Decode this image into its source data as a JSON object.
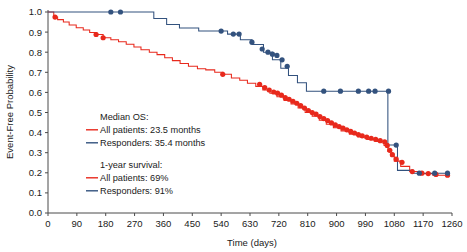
{
  "chart_data": {
    "type": "line",
    "title": "",
    "xlabel": "Time (days)",
    "ylabel": "Event-Free Probability",
    "xlim": [
      0,
      1260
    ],
    "ylim": [
      0.0,
      1.0
    ],
    "grid": false,
    "legend_position": "inside-left",
    "xticks": [
      0,
      90,
      180,
      270,
      360,
      450,
      540,
      630,
      720,
      810,
      900,
      990,
      1080,
      1170,
      1260
    ],
    "ytick_labels": [
      "1.0",
      "0.9",
      "0.8",
      "0.7",
      "0.6",
      "0.5",
      "0.4",
      "0.3",
      "0.2",
      "0.1",
      "0.0"
    ],
    "ytick_values": [
      1.0,
      0.9,
      0.8,
      0.7,
      0.6,
      0.5,
      0.4,
      0.3,
      0.2,
      0.1,
      0.0
    ],
    "series": [
      {
        "name": "All patients",
        "color": "#e8291c",
        "marker": "censor-circle",
        "steps": [
          [
            0,
            1.0
          ],
          [
            18,
            1.0
          ],
          [
            18,
            0.975
          ],
          [
            30,
            0.975
          ],
          [
            30,
            0.962
          ],
          [
            48,
            0.962
          ],
          [
            48,
            0.95
          ],
          [
            66,
            0.95
          ],
          [
            66,
            0.935
          ],
          [
            88,
            0.935
          ],
          [
            88,
            0.922
          ],
          [
            110,
            0.922
          ],
          [
            110,
            0.91
          ],
          [
            130,
            0.91
          ],
          [
            130,
            0.898
          ],
          [
            152,
            0.898
          ],
          [
            152,
            0.888
          ],
          [
            172,
            0.888
          ],
          [
            172,
            0.872
          ],
          [
            196,
            0.872
          ],
          [
            196,
            0.862
          ],
          [
            220,
            0.862
          ],
          [
            220,
            0.852
          ],
          [
            244,
            0.852
          ],
          [
            244,
            0.84
          ],
          [
            268,
            0.84
          ],
          [
            268,
            0.826
          ],
          [
            290,
            0.826
          ],
          [
            290,
            0.812
          ],
          [
            316,
            0.812
          ],
          [
            316,
            0.8
          ],
          [
            340,
            0.8
          ],
          [
            340,
            0.788
          ],
          [
            364,
            0.788
          ],
          [
            364,
            0.772
          ],
          [
            388,
            0.772
          ],
          [
            388,
            0.758
          ],
          [
            412,
            0.758
          ],
          [
            412,
            0.744
          ],
          [
            438,
            0.744
          ],
          [
            438,
            0.73
          ],
          [
            466,
            0.73
          ],
          [
            466,
            0.718
          ],
          [
            492,
            0.718
          ],
          [
            492,
            0.712
          ],
          [
            520,
            0.712
          ],
          [
            520,
            0.7
          ],
          [
            546,
            0.7
          ],
          [
            546,
            0.69
          ],
          [
            572,
            0.69
          ],
          [
            572,
            0.672
          ],
          [
            598,
            0.672
          ],
          [
            598,
            0.66
          ],
          [
            622,
            0.66
          ],
          [
            622,
            0.646
          ],
          [
            648,
            0.646
          ],
          [
            648,
            0.63
          ],
          [
            670,
            0.63
          ],
          [
            670,
            0.612
          ],
          [
            692,
            0.612
          ],
          [
            692,
            0.596
          ],
          [
            714,
            0.596
          ],
          [
            714,
            0.578
          ],
          [
            736,
            0.578
          ],
          [
            736,
            0.56
          ],
          [
            758,
            0.56
          ],
          [
            758,
            0.542
          ],
          [
            780,
            0.542
          ],
          [
            780,
            0.522
          ],
          [
            802,
            0.522
          ],
          [
            802,
            0.5
          ],
          [
            824,
            0.5
          ],
          [
            824,
            0.482
          ],
          [
            846,
            0.482
          ],
          [
            846,
            0.462
          ],
          [
            868,
            0.462
          ],
          [
            868,
            0.442
          ],
          [
            890,
            0.442
          ],
          [
            890,
            0.424
          ],
          [
            914,
            0.424
          ],
          [
            914,
            0.408
          ],
          [
            940,
            0.408
          ],
          [
            940,
            0.392
          ],
          [
            966,
            0.392
          ],
          [
            966,
            0.378
          ],
          [
            994,
            0.378
          ],
          [
            994,
            0.366
          ],
          [
            1022,
            0.366
          ],
          [
            1022,
            0.356
          ],
          [
            1048,
            0.356
          ],
          [
            1048,
            0.336
          ],
          [
            1060,
            0.336
          ],
          [
            1060,
            0.306
          ],
          [
            1070,
            0.306
          ],
          [
            1070,
            0.282
          ],
          [
            1080,
            0.282
          ],
          [
            1080,
            0.258
          ],
          [
            1100,
            0.258
          ],
          [
            1100,
            0.232
          ],
          [
            1128,
            0.232
          ],
          [
            1128,
            0.206
          ],
          [
            1160,
            0.206
          ],
          [
            1160,
            0.196
          ],
          [
            1200,
            0.196
          ],
          [
            1200,
            0.188
          ],
          [
            1246,
            0.188
          ]
        ],
        "censors": [
          [
            22,
            0.975
          ],
          [
            150,
            0.888
          ],
          [
            172,
            0.872
          ],
          [
            545,
            0.69
          ],
          [
            660,
            0.64
          ],
          [
            676,
            0.624
          ],
          [
            690,
            0.612
          ],
          [
            704,
            0.602
          ],
          [
            716,
            0.596
          ],
          [
            728,
            0.586
          ],
          [
            740,
            0.574
          ],
          [
            752,
            0.566
          ],
          [
            764,
            0.556
          ],
          [
            776,
            0.546
          ],
          [
            788,
            0.534
          ],
          [
            800,
            0.522
          ],
          [
            812,
            0.51
          ],
          [
            824,
            0.5
          ],
          [
            836,
            0.492
          ],
          [
            848,
            0.48
          ],
          [
            860,
            0.47
          ],
          [
            872,
            0.46
          ],
          [
            884,
            0.448
          ],
          [
            896,
            0.438
          ],
          [
            908,
            0.43
          ],
          [
            920,
            0.422
          ],
          [
            932,
            0.414
          ],
          [
            944,
            0.406
          ],
          [
            956,
            0.398
          ],
          [
            968,
            0.39
          ],
          [
            980,
            0.384
          ],
          [
            994,
            0.378
          ],
          [
            1008,
            0.372
          ],
          [
            1022,
            0.366
          ],
          [
            1036,
            0.36
          ],
          [
            1050,
            0.354
          ],
          [
            1058,
            0.336
          ],
          [
            1066,
            0.312
          ],
          [
            1074,
            0.29
          ],
          [
            1086,
            0.268
          ],
          [
            1104,
            0.252
          ],
          [
            1136,
            0.206
          ],
          [
            1166,
            0.198
          ],
          [
            1186,
            0.196
          ],
          [
            1210,
            0.192
          ],
          [
            1246,
            0.188
          ]
        ]
      },
      {
        "name": "Responders",
        "color": "#33527e",
        "marker": "censor-circle",
        "steps": [
          [
            0,
            1.0
          ],
          [
            330,
            1.0
          ],
          [
            330,
            0.968
          ],
          [
            370,
            0.968
          ],
          [
            370,
            0.938
          ],
          [
            410,
            0.938
          ],
          [
            410,
            0.92
          ],
          [
            470,
            0.92
          ],
          [
            470,
            0.905
          ],
          [
            560,
            0.905
          ],
          [
            560,
            0.89
          ],
          [
            600,
            0.89
          ],
          [
            600,
            0.862
          ],
          [
            636,
            0.862
          ],
          [
            636,
            0.838
          ],
          [
            672,
            0.838
          ],
          [
            672,
            0.8
          ],
          [
            700,
            0.8
          ],
          [
            700,
            0.762
          ],
          [
            726,
            0.762
          ],
          [
            726,
            0.72
          ],
          [
            750,
            0.72
          ],
          [
            750,
            0.684
          ],
          [
            778,
            0.684
          ],
          [
            778,
            0.648
          ],
          [
            806,
            0.648
          ],
          [
            806,
            0.606
          ],
          [
            1060,
            0.606
          ],
          [
            1060,
            0.338
          ],
          [
            1090,
            0.338
          ],
          [
            1090,
            0.212
          ],
          [
            1140,
            0.212
          ],
          [
            1140,
            0.198
          ],
          [
            1246,
            0.198
          ]
        ],
        "censors": [
          [
            196,
            1.0
          ],
          [
            226,
            1.0
          ],
          [
            540,
            0.905
          ],
          [
            578,
            0.89
          ],
          [
            596,
            0.89
          ],
          [
            636,
            0.85
          ],
          [
            668,
            0.816
          ],
          [
            686,
            0.8
          ],
          [
            700,
            0.79
          ],
          [
            714,
            0.784
          ],
          [
            730,
            0.762
          ],
          [
            746,
            0.73
          ],
          [
            860,
            0.606
          ],
          [
            912,
            0.606
          ],
          [
            968,
            0.606
          ],
          [
            1000,
            0.606
          ],
          [
            1020,
            0.606
          ],
          [
            1062,
            0.606
          ],
          [
            1086,
            0.338
          ],
          [
            1158,
            0.198
          ],
          [
            1206,
            0.198
          ],
          [
            1246,
            0.198
          ]
        ]
      }
    ],
    "annotations": [
      {
        "id": "median-os",
        "heading": "Median OS:",
        "rows": [
          {
            "color": "#e8291c",
            "text": "All patients: 23.5 months"
          },
          {
            "color": "#33527e",
            "text": "Responders: 35.4 months"
          }
        ]
      },
      {
        "id": "one-year-survival",
        "heading": "1-year survival:",
        "rows": [
          {
            "color": "#e8291c",
            "text": "All patients: 69%"
          },
          {
            "color": "#33527e",
            "text": "Responders: 91%"
          }
        ]
      }
    ]
  },
  "legend": {
    "median_os_heading": "Median OS:",
    "median_os_all": "All patients: 23.5 months",
    "median_os_responders": "Responders: 35.4 months",
    "one_year_heading": "1-year survival:",
    "one_year_all": "All patients: 69%",
    "one_year_responders": "Responders: 91%"
  },
  "axes": {
    "x_title": "Time (days)",
    "y_title": "Event-Free Probability"
  },
  "colors": {
    "all_patients": "#e8291c",
    "responders": "#33527e",
    "axis": "#4a4a4a",
    "text": "#1a1a1a"
  }
}
